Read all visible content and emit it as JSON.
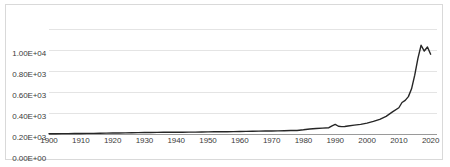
{
  "chart_data": {
    "type": "line",
    "title": "",
    "subtitle": "",
    "xlabel": "",
    "ylabel": "",
    "grid": true,
    "legend": false,
    "legend_position": "none",
    "line_color": "#262626",
    "gridline_color": "#e4e4e4",
    "axis_color": "#9a9a9a",
    "border_color": "#d9d9d9",
    "xlim": [
      1900,
      2022
    ],
    "ylim": [
      0,
      1000
    ],
    "xticks": [
      1900,
      1910,
      1920,
      1930,
      1940,
      1950,
      1960,
      1970,
      1980,
      1990,
      2000,
      2010,
      2020
    ],
    "xtick_labels": [
      "1900",
      "1910",
      "1920",
      "1930",
      "1940",
      "1950",
      "1960",
      "1970",
      "1980",
      "1990",
      "2000",
      "2010",
      "2020"
    ],
    "yticks": [
      0,
      200,
      400,
      600,
      800,
      1000
    ],
    "ytick_labels": [
      "0.00E+00",
      "0.20E+03",
      "0.40E+03",
      "0.60E+03",
      "0.80E+03",
      "1.00E+04"
    ],
    "series": [
      {
        "name": "series-1",
        "x": [
          1900,
          1902,
          1904,
          1906,
          1908,
          1910,
          1912,
          1914,
          1916,
          1918,
          1920,
          1922,
          1924,
          1926,
          1928,
          1930,
          1932,
          1934,
          1936,
          1938,
          1940,
          1942,
          1944,
          1946,
          1948,
          1950,
          1952,
          1954,
          1956,
          1958,
          1960,
          1962,
          1964,
          1966,
          1968,
          1970,
          1972,
          1974,
          1976,
          1978,
          1980,
          1982,
          1984,
          1986,
          1988,
          1989,
          1990,
          1991,
          1992,
          1993,
          1994,
          1996,
          1998,
          2000,
          2002,
          2004,
          2006,
          2008,
          2010,
          2011,
          2012,
          2013,
          2014,
          2015,
          2016,
          2017,
          2018,
          2019,
          2020
        ],
        "y": [
          3,
          3,
          4,
          4,
          5,
          5,
          6,
          6,
          7,
          8,
          9,
          10,
          11,
          12,
          13,
          14,
          14,
          15,
          16,
          16,
          17,
          17,
          18,
          18,
          19,
          20,
          21,
          22,
          22,
          23,
          24,
          25,
          26,
          27,
          28,
          29,
          30,
          31,
          33,
          34,
          40,
          48,
          52,
          56,
          60,
          78,
          92,
          74,
          70,
          72,
          76,
          84,
          92,
          104,
          120,
          140,
          168,
          210,
          250,
          300,
          320,
          356,
          430,
          560,
          720,
          845,
          790,
          828,
          760
        ]
      }
    ]
  }
}
